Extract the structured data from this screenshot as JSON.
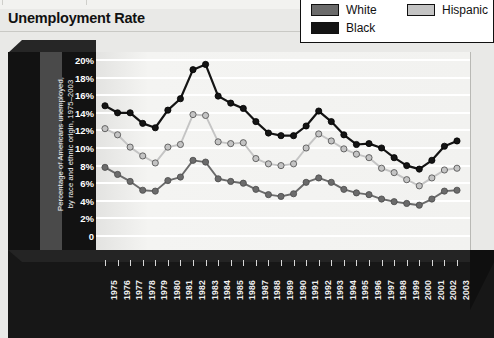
{
  "title": "Unemployment Rate",
  "legend": {
    "items": [
      {
        "label": "White",
        "color": "#6b6b6b"
      },
      {
        "label": "Hispanic",
        "color": "#c4c4c4"
      },
      {
        "label": "Black",
        "color": "#141414"
      }
    ]
  },
  "axes": {
    "ylabel": "Percentage of Americans unemployed,\nby race and ethnic origin, 1975–2003",
    "yticks": [
      "20%",
      "18%",
      "16%",
      "14%",
      "12%",
      "10%",
      "8%",
      "6%",
      "4%",
      "2%",
      "0"
    ]
  },
  "colors": {
    "white_series": "#6b6b6b",
    "hispanic_series": "#c4c4c4",
    "black_series": "#141414",
    "panel": "#f1f1ef",
    "grid": "#ffffff",
    "frame_dark": "#121212",
    "ylabel_panel": "#4a4a4a",
    "page_bg": "#e9e9e7"
  },
  "chart_data": {
    "type": "line",
    "title": "Unemployment Rate",
    "xlabel": "",
    "ylabel": "Percentage of Americans unemployed, by race and ethnic origin, 1975–2003",
    "ylim": [
      0,
      22
    ],
    "xlim": [
      1975,
      2003
    ],
    "grid": true,
    "legend_position": "top-right",
    "categories": [
      "1975",
      "1976",
      "1977",
      "1978",
      "1979",
      "1980",
      "1981",
      "1982",
      "1983",
      "1984",
      "1985",
      "1986",
      "1987",
      "1988",
      "1989",
      "1990",
      "1991",
      "1992",
      "1993",
      "1994",
      "1995",
      "1996",
      "1997",
      "1998",
      "1999",
      "2000",
      "2001",
      "2002",
      "2003"
    ],
    "series": [
      {
        "name": "Black",
        "color": "#141414",
        "values": [
          14.8,
          14.0,
          14.0,
          12.8,
          12.3,
          14.3,
          15.6,
          18.9,
          19.5,
          15.9,
          15.1,
          14.5,
          13.0,
          11.7,
          11.4,
          11.4,
          12.5,
          14.2,
          13.0,
          11.5,
          10.4,
          10.5,
          10.0,
          8.9,
          8.0,
          7.6,
          8.6,
          10.2,
          10.8
        ]
      },
      {
        "name": "Hispanic",
        "color": "#c4c4c4",
        "values": [
          12.2,
          11.5,
          10.1,
          9.1,
          8.3,
          10.1,
          10.4,
          13.8,
          13.7,
          10.7,
          10.5,
          10.6,
          8.8,
          8.2,
          8.0,
          8.2,
          10.0,
          11.6,
          10.8,
          9.9,
          9.3,
          8.9,
          7.7,
          7.2,
          6.4,
          5.7,
          6.6,
          7.5,
          7.7
        ]
      },
      {
        "name": "White",
        "color": "#6b6b6b",
        "values": [
          7.8,
          7.0,
          6.2,
          5.2,
          5.1,
          6.3,
          6.7,
          8.6,
          8.4,
          6.5,
          6.2,
          6.0,
          5.3,
          4.7,
          4.5,
          4.8,
          6.1,
          6.6,
          6.1,
          5.3,
          4.9,
          4.7,
          4.2,
          3.9,
          3.7,
          3.5,
          4.2,
          5.1,
          5.2
        ]
      }
    ]
  }
}
